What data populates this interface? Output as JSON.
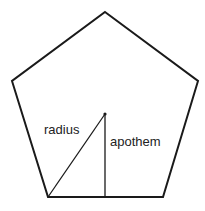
{
  "diagram": {
    "shape": "pentagon",
    "stroke_color": "#1a1a1a",
    "background_color": "#ffffff",
    "vertices": [
      {
        "x": 105,
        "y": 12
      },
      {
        "x": 198,
        "y": 81
      },
      {
        "x": 163,
        "y": 197
      },
      {
        "x": 48,
        "y": 197
      },
      {
        "x": 12,
        "y": 81
      }
    ],
    "center": {
      "x": 105,
      "y": 114
    },
    "segments": {
      "radius": {
        "from": {
          "x": 105,
          "y": 114
        },
        "to": {
          "x": 48,
          "y": 197
        }
      },
      "apothem": {
        "from": {
          "x": 105,
          "y": 114
        },
        "to": {
          "x": 105,
          "y": 197
        }
      }
    },
    "labels": {
      "radius": "radius",
      "apothem": "apothem"
    }
  }
}
